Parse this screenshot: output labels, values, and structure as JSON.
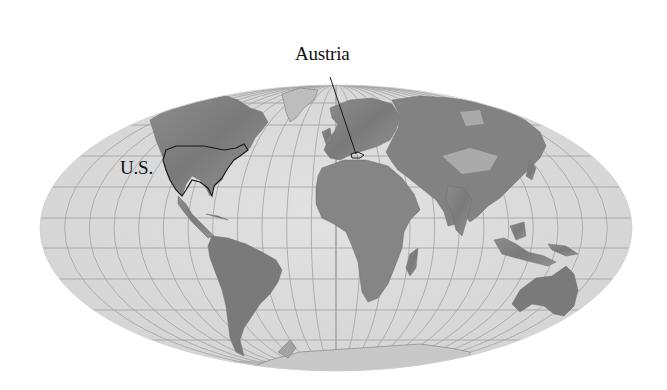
{
  "map": {
    "projection": "mollweide-like world projection",
    "style": "grayscale shaded relief",
    "colors": {
      "background": "#ffffff",
      "ocean": "#dcdcdc",
      "graticule": "#9a9a9a",
      "land_dark": "#7c7c7c",
      "land_mid": "#9c9c9c",
      "land_light": "#c4c4c4",
      "outline": "#1a1a1a"
    },
    "labels": [
      {
        "id": "austria",
        "text": "Austria",
        "points_to": "Austria (central Europe)"
      },
      {
        "id": "us",
        "text": "U.S.",
        "points_to": "United States (outlined)"
      }
    ],
    "highlighted_regions": [
      "U.S.",
      "Austria"
    ]
  }
}
